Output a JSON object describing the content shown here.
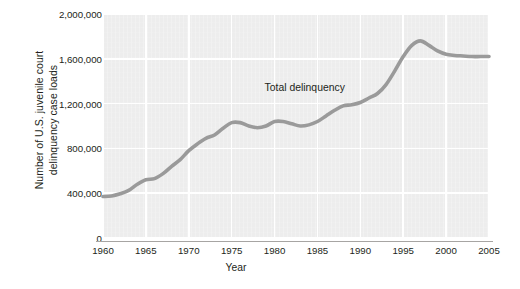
{
  "chart_data": {
    "type": "line",
    "title": "",
    "xlabel": "Year",
    "ylabel": "Number of U.S. juvenile court delinquency case loads",
    "ylabel_line1": "Number of U.S. juvenile court",
    "ylabel_line2": "delinquency case loads",
    "xlim": [
      1960,
      2005
    ],
    "ylim": [
      0,
      2000000
    ],
    "grid": true,
    "legend_position": "none",
    "line_color": "#9a9a9a",
    "plot_background": "#ededed",
    "gridline_color": "#ffffff",
    "text_color": "#231f20",
    "xticks": [
      1960,
      1965,
      1970,
      1975,
      1980,
      1985,
      1990,
      1995,
      2000,
      2005
    ],
    "xtick_labels": [
      "1960",
      "1965",
      "1970",
      "1975",
      "1980",
      "1985",
      "1990",
      "1995",
      "2000",
      "2005"
    ],
    "yticks": [
      0,
      400000,
      800000,
      1200000,
      1600000,
      2000000
    ],
    "ytick_labels": [
      "0",
      "400,000",
      "800,000",
      "1,200,000",
      "1,600,000",
      "2,000,000"
    ],
    "annotations": [
      {
        "text": "Total delinquency",
        "x": 1983.5,
        "y": 1330000
      }
    ],
    "series": [
      {
        "name": "Total delinquency",
        "x": [
          1960,
          1961,
          1962,
          1963,
          1964,
          1965,
          1966,
          1967,
          1968,
          1969,
          1970,
          1971,
          1972,
          1973,
          1974,
          1975,
          1976,
          1977,
          1978,
          1979,
          1980,
          1981,
          1982,
          1983,
          1984,
          1985,
          1986,
          1987,
          1988,
          1989,
          1990,
          1991,
          1992,
          1993,
          1994,
          1995,
          1996,
          1997,
          1998,
          1999,
          2000,
          2001,
          2002,
          2003,
          2004,
          2005
        ],
        "values": [
          370000,
          375000,
          395000,
          425000,
          480000,
          520000,
          530000,
          575000,
          640000,
          700000,
          780000,
          840000,
          890000,
          920000,
          980000,
          1030000,
          1030000,
          1000000,
          985000,
          1000000,
          1040000,
          1040000,
          1020000,
          1000000,
          1010000,
          1040000,
          1090000,
          1140000,
          1180000,
          1190000,
          1210000,
          1250000,
          1290000,
          1370000,
          1490000,
          1620000,
          1720000,
          1760000,
          1720000,
          1670000,
          1640000,
          1630000,
          1625000,
          1620000,
          1620000,
          1620000
        ]
      }
    ]
  }
}
